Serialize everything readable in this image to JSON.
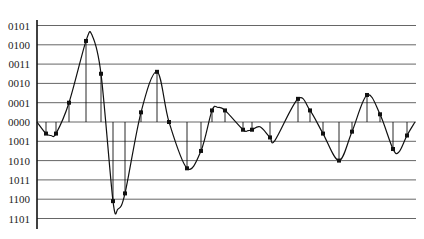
{
  "chart_data": {
    "type": "line",
    "title": "",
    "xlabel": "",
    "ylabel": "",
    "y_tick_labels": [
      "0101",
      "0100",
      "0011",
      "0010",
      "0001",
      "0000",
      "1001",
      "1010",
      "1011",
      "1100",
      "1101"
    ],
    "y_tick_values": [
      5,
      4,
      3,
      2,
      1,
      0,
      -1,
      -2,
      -3,
      -4,
      -5
    ],
    "ylim": [
      -5.5,
      5.5
    ],
    "grid": "horizontal",
    "samples": {
      "x": [
        46,
        56,
        69,
        86,
        101,
        113,
        125,
        141,
        157,
        169,
        187,
        201,
        212,
        225,
        243,
        252,
        270,
        298,
        310,
        323,
        339,
        352,
        367,
        380,
        393,
        407
      ],
      "values": [
        -0.6,
        -0.6,
        1.0,
        4.2,
        2.5,
        -4.1,
        -3.7,
        0.5,
        2.6,
        0.0,
        -2.4,
        -1.5,
        0.6,
        0.6,
        -0.4,
        -0.4,
        -0.8,
        1.2,
        0.6,
        -0.6,
        -2.0,
        -0.5,
        1.4,
        0.4,
        -1.4,
        -0.7
      ]
    },
    "curve": {
      "x": [
        37,
        46,
        51,
        56,
        69,
        86,
        92,
        101,
        113,
        118,
        125,
        141,
        157,
        169,
        187,
        201,
        212,
        218,
        225,
        243,
        248,
        252,
        260,
        270,
        275,
        298,
        310,
        323,
        339,
        352,
        367,
        380,
        393,
        399,
        407,
        415
      ],
      "values": [
        0.0,
        -0.6,
        -0.7,
        -0.6,
        1.0,
        4.2,
        4.5,
        2.5,
        -4.1,
        -4.5,
        -3.7,
        0.5,
        2.6,
        0.0,
        -2.4,
        -1.5,
        0.6,
        0.75,
        0.6,
        -0.4,
        -0.45,
        -0.4,
        -0.25,
        -0.8,
        -0.95,
        1.2,
        0.6,
        -0.6,
        -2.0,
        -0.5,
        1.4,
        0.4,
        -1.4,
        -1.55,
        -0.7,
        0.0
      ]
    }
  },
  "layout": {
    "axis_x": 37,
    "axis_top": 20,
    "axis_bottom": 229,
    "grid_right": 416,
    "zero_y": 122,
    "unit_px": 19.3,
    "line_color": "#111111",
    "grid_color": "#555555"
  }
}
